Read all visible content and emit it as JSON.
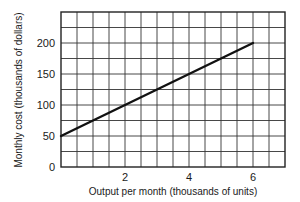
{
  "chart_data": {
    "type": "line",
    "title": "",
    "xlabel": "Output per month (thousands of units)",
    "ylabel": "Monthly cost (thousands of dollars)",
    "xlim": [
      0,
      7
    ],
    "ylim": [
      0,
      250
    ],
    "x_ticks": [
      2,
      4,
      6
    ],
    "y_ticks": [
      0,
      50,
      100,
      150,
      200
    ],
    "grid": true,
    "grid_x_step": 0.5,
    "grid_y_step": 25,
    "series": [
      {
        "name": "Monthly cost",
        "x": [
          0,
          1,
          2,
          3,
          4,
          5,
          6
        ],
        "y": [
          50,
          75,
          100,
          125,
          150,
          175,
          200
        ]
      }
    ],
    "line_color": "#111111"
  }
}
